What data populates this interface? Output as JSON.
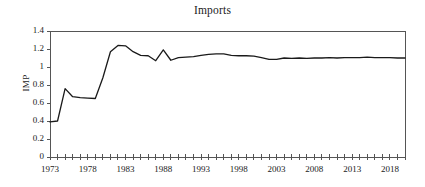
{
  "chart_data": {
    "type": "line",
    "title": "Imports",
    "xlabel": "",
    "ylabel": "IMP",
    "ylim": [
      0,
      1.4
    ],
    "xlim": [
      1973,
      2020
    ],
    "ytick_labels": [
      "1.4",
      "1.2",
      "1",
      "0.8",
      "0.6",
      "0.4",
      "0.2",
      "0"
    ],
    "ytick_values": [
      1.4,
      1.2,
      1.0,
      0.8,
      0.6,
      0.4,
      0.2,
      0
    ],
    "xtick_labels": [
      "1973",
      "1978",
      "1983",
      "1988",
      "1993",
      "1998",
      "2003",
      "2008",
      "2013",
      "2018"
    ],
    "xtick_values": [
      1973,
      1978,
      1983,
      1988,
      1993,
      1998,
      2003,
      2008,
      2013,
      2018
    ],
    "xtick_minor_step": 1,
    "grid": false,
    "legend": "none",
    "line_color": "#1a1a1a",
    "line_width": 1.3,
    "series": [
      {
        "name": "IMP",
        "x": [
          1973,
          1974,
          1975,
          1976,
          1977,
          1978,
          1979,
          1980,
          1981,
          1982,
          1983,
          1984,
          1985,
          1986,
          1987,
          1988,
          1989,
          1990,
          1991,
          1992,
          1993,
          1994,
          1995,
          1996,
          1997,
          1998,
          1999,
          2000,
          2001,
          2002,
          2003,
          2004,
          2005,
          2006,
          2007,
          2008,
          2009,
          2010,
          2011,
          2012,
          2013,
          2014,
          2015,
          2016,
          2017,
          2018,
          2019,
          2020
        ],
        "values": [
          0.39,
          0.4,
          0.76,
          0.67,
          0.66,
          0.655,
          0.65,
          0.88,
          1.17,
          1.24,
          1.235,
          1.17,
          1.13,
          1.125,
          1.07,
          1.19,
          1.075,
          1.105,
          1.11,
          1.115,
          1.13,
          1.14,
          1.145,
          1.145,
          1.13,
          1.125,
          1.125,
          1.12,
          1.105,
          1.085,
          1.085,
          1.1,
          1.095,
          1.1,
          1.095,
          1.1,
          1.1,
          1.105,
          1.1,
          1.105,
          1.105,
          1.105,
          1.11,
          1.105,
          1.105,
          1.105,
          1.1,
          1.1
        ]
      }
    ]
  },
  "axes": {
    "frame_left": 50,
    "frame_right": 405,
    "frame_top": 31,
    "frame_bottom": 157
  }
}
